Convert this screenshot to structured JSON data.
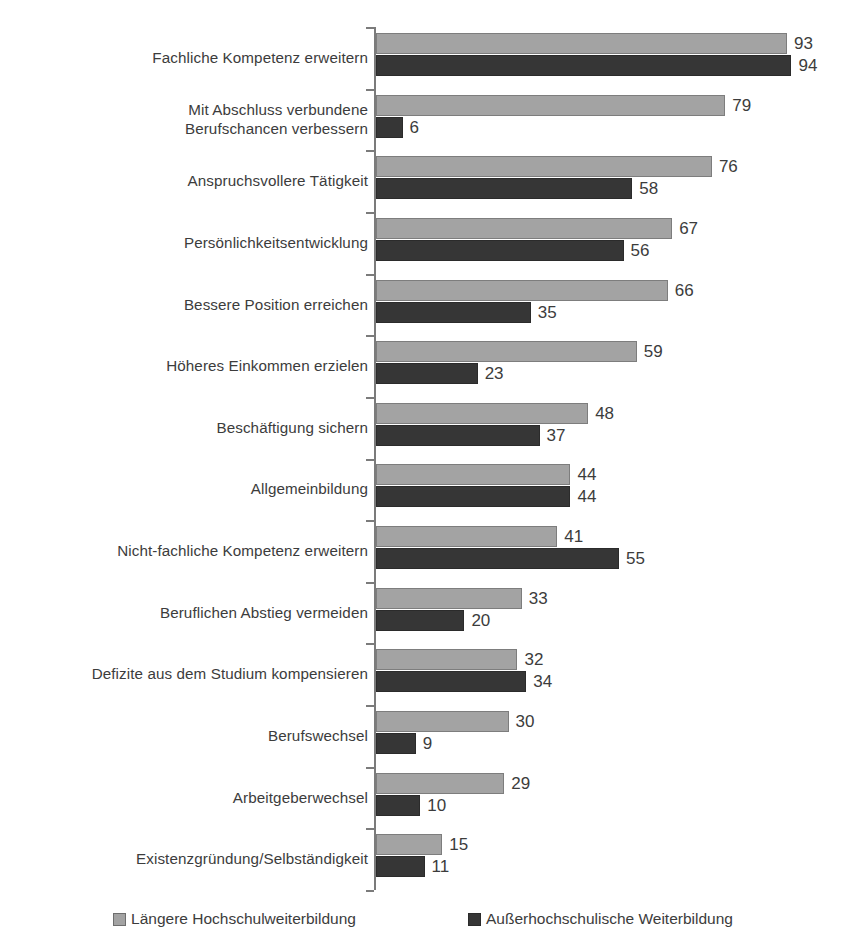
{
  "chart_data": {
    "type": "bar",
    "orientation": "horizontal",
    "title": "",
    "subtitle": "",
    "xlabel": "",
    "ylabel": "",
    "xlim": [
      0,
      100
    ],
    "grid": false,
    "legend_position": "bottom",
    "categories": [
      "Fachliche Kompetenz erweitern",
      "Mit Abschluss verbundene\nBerufschancen verbessern",
      "Anspruchsvollere Tätigkeit",
      "Persönlichkeitsentwicklung",
      "Bessere Position erreichen",
      "Höheres Einkommen erzielen",
      "Beschäftigung sichern",
      "Allgemeinbildung",
      "Nicht-fachliche Kompetenz erweitern",
      "Beruflichen Abstieg vermeiden",
      "Defizite aus dem Studium kompensieren",
      "Berufswechsel",
      "Arbeitgeberwechsel",
      "Existenzgründung/Selbständigkeit"
    ],
    "series": [
      {
        "name": "Längere Hochschulweiterbildung",
        "color": "#a3a3a3",
        "values": [
          93,
          79,
          76,
          67,
          66,
          59,
          48,
          44,
          41,
          33,
          32,
          30,
          29,
          15
        ]
      },
      {
        "name": "Außerhochschulische Weiterbildung",
        "color": "#363636",
        "values": [
          94,
          6,
          58,
          56,
          35,
          23,
          37,
          44,
          55,
          20,
          34,
          9,
          10,
          11
        ]
      }
    ]
  },
  "rows": [
    {
      "label_line1": "Fachliche Kompetenz erweitern",
      "label_line2": "",
      "light": 93,
      "dark": 94,
      "light_text": "93",
      "dark_text": "94"
    },
    {
      "label_line1": "Mit Abschluss verbundene",
      "label_line2": "Berufschancen verbessern",
      "light": 79,
      "dark": 6,
      "light_text": "79",
      "dark_text": "6"
    },
    {
      "label_line1": "Anspruchsvollere Tätigkeit",
      "label_line2": "",
      "light": 76,
      "dark": 58,
      "light_text": "76",
      "dark_text": "58"
    },
    {
      "label_line1": "Persönlichkeitsentwicklung",
      "label_line2": "",
      "light": 67,
      "dark": 56,
      "light_text": "67",
      "dark_text": "56"
    },
    {
      "label_line1": "Bessere Position erreichen",
      "label_line2": "",
      "light": 66,
      "dark": 35,
      "light_text": "66",
      "dark_text": "35"
    },
    {
      "label_line1": "Höheres Einkommen erzielen",
      "label_line2": "",
      "light": 59,
      "dark": 23,
      "light_text": "59",
      "dark_text": "23"
    },
    {
      "label_line1": "Beschäftigung sichern",
      "label_line2": "",
      "light": 48,
      "dark": 37,
      "light_text": "48",
      "dark_text": "37"
    },
    {
      "label_line1": "Allgemeinbildung",
      "label_line2": "",
      "light": 44,
      "dark": 44,
      "light_text": "44",
      "dark_text": "44"
    },
    {
      "label_line1": "Nicht-fachliche Kompetenz erweitern",
      "label_line2": "",
      "light": 41,
      "dark": 55,
      "light_text": "41",
      "dark_text": "55"
    },
    {
      "label_line1": "Beruflichen Abstieg vermeiden",
      "label_line2": "",
      "light": 33,
      "dark": 20,
      "light_text": "33",
      "dark_text": "20"
    },
    {
      "label_line1": "Defizite aus dem Studium kompensieren",
      "label_line2": "",
      "light": 32,
      "dark": 34,
      "light_text": "32",
      "dark_text": "34"
    },
    {
      "label_line1": "Berufswechsel",
      "label_line2": "",
      "light": 30,
      "dark": 9,
      "light_text": "30",
      "dark_text": "9"
    },
    {
      "label_line1": "Arbeitgeberwechsel",
      "label_line2": "",
      "light": 29,
      "dark": 10,
      "light_text": "29",
      "dark_text": "10"
    },
    {
      "label_line1": "Existenzgründung/Selbständigkeit",
      "label_line2": "",
      "light": 15,
      "dark": 11,
      "light_text": "15",
      "dark_text": "11"
    }
  ],
  "legend": {
    "items": [
      {
        "label": "Längere Hochschulweiterbildung",
        "swatch": "light"
      },
      {
        "label": "Außerhochschulische Weiterbildung",
        "swatch": "dark"
      }
    ]
  },
  "scale": {
    "px_per_unit": 4.42
  }
}
